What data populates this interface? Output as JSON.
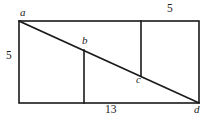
{
  "figure": {
    "stroke_color": "#1a1a1a",
    "background_color": "#ffffff",
    "labels": {
      "vertex_a": "a",
      "vertex_b": "b",
      "vertex_c": "c",
      "vertex_d": "d",
      "left_side": "5",
      "top_right_segment": "5",
      "bottom_side": "13"
    },
    "geometry": {
      "rectangle": {
        "left": 19,
        "top": 21,
        "right": 199,
        "bottom": 103
      },
      "diagonal": {
        "from": "a",
        "to": "d",
        "x1": 19,
        "y1": 21,
        "x2": 199,
        "y2": 103
      },
      "vertical_segment_1": {
        "x": 84,
        "y_top": 50,
        "y_bottom": 103,
        "top_point": "b"
      },
      "vertical_segment_2": {
        "x": 141,
        "y_top": 21,
        "y_bottom": 76,
        "bottom_point": "c"
      }
    }
  }
}
